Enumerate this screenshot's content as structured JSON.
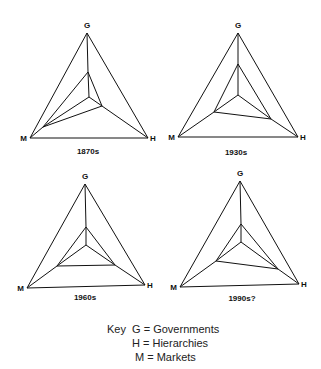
{
  "figure": {
    "type": "governance-triangle-diagrams",
    "vertex_labels": {
      "G": "G",
      "H": "H",
      "M": "M"
    },
    "panels": [
      {
        "era": "1870s",
        "inner_emphasis_estimate": {
          "G": 0.4,
          "H": 0.25,
          "M": 0.8
        }
      },
      {
        "era": "1930s",
        "inner_emphasis_estimate": {
          "G": 0.55,
          "H": 0.55,
          "M": 0.45
        }
      },
      {
        "era": "1960s",
        "inner_emphasis_estimate": {
          "G": 0.3,
          "H": 0.5,
          "M": 0.5
        }
      },
      {
        "era": "1990s?",
        "inner_emphasis_estimate": {
          "G": 0.3,
          "H": 0.35,
          "M": 0.5
        }
      }
    ],
    "emphasis_note": "Estimated relative emphasis only; the figure has no scale, so these are reconstructed from the drawing, not read values."
  },
  "key": {
    "title": "Key",
    "entries": [
      {
        "symbol": "G",
        "text": "G = Governments"
      },
      {
        "symbol": "H",
        "text": "H = Hierarchies"
      },
      {
        "symbol": "M",
        "text": "M = Markets"
      }
    ]
  }
}
